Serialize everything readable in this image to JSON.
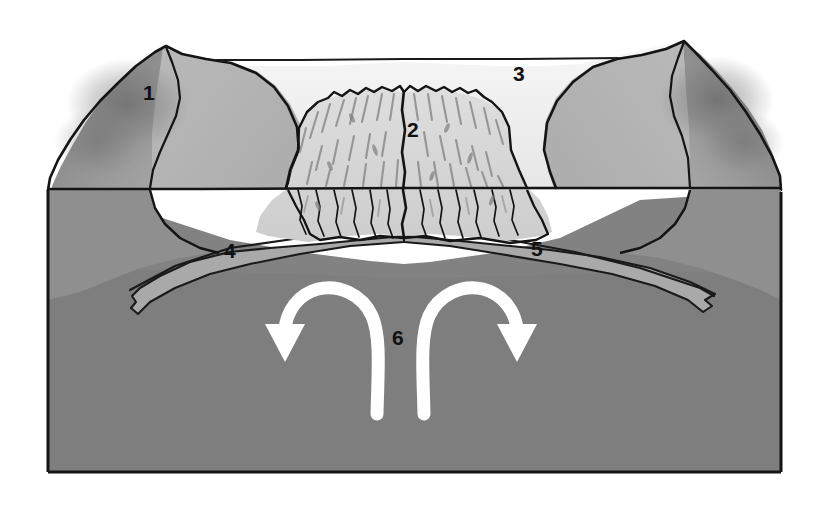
{
  "figure": {
    "kind": "block-diagram",
    "background_color": "#ffffff"
  },
  "labels": [
    {
      "id": "1",
      "text": "1",
      "x": 143,
      "y": 82,
      "describes": "left-side continental / oceanic crust mountain mass"
    },
    {
      "id": "2",
      "text": "2",
      "x": 407,
      "y": 119,
      "describes": "mid-ocean ridge with central rift valley"
    },
    {
      "id": "3",
      "text": "3",
      "x": 513,
      "y": 63,
      "describes": "ocean water / sea surface layer"
    },
    {
      "id": "4",
      "text": "4",
      "x": 224,
      "y": 240,
      "describes": "left lithospheric plate moving away from ridge"
    },
    {
      "id": "5",
      "text": "5",
      "x": 531,
      "y": 238,
      "describes": "right lithospheric plate moving away from ridge"
    },
    {
      "id": "6",
      "text": "6",
      "x": 392,
      "y": 327,
      "describes": "mantle convection cells"
    }
  ],
  "arrows": [
    {
      "name": "left-convection-arrow",
      "direction": "counterclockwise",
      "head_points": "down-left",
      "color": "#ffffff"
    },
    {
      "name": "right-convection-arrow",
      "direction": "clockwise",
      "head_points": "down-right",
      "color": "#ffffff"
    }
  ],
  "palette": {
    "outline": "#141414",
    "sea_water": "#f0f0f0",
    "ridge_light": "#d8d8d8",
    "ridge_flank": "#cfcfcf",
    "mountain_mid": "#b4b4b4",
    "mountain_dark": "#8e8e8e",
    "mountain_shadow": "#7a7a7a",
    "lithosphere_band": "#a9a9a9",
    "mantle": "#828282",
    "mantle_deep": "#7b7b7b",
    "arrow_white": "#ffffff",
    "label_text": "#111111"
  },
  "geometry": {
    "block_left": 48,
    "block_right": 781,
    "block_bottom": 472,
    "sea_level_line_y": 188,
    "left_peak": {
      "x": 165,
      "y": 45
    },
    "right_peak": {
      "x": 683,
      "y": 42
    },
    "ridge_crest_y": 92,
    "rift_center_x": 404
  }
}
